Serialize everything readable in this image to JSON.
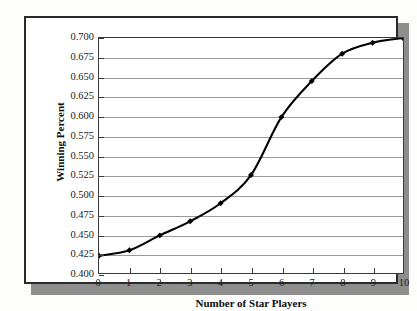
{
  "chart_data": {
    "type": "line",
    "title": "",
    "xlabel": "Number of Star Players",
    "ylabel": "Winning Percent",
    "x": [
      0,
      1,
      2,
      3,
      4,
      5,
      6,
      7,
      8,
      9,
      10
    ],
    "values": [
      0.422,
      0.429,
      0.448,
      0.466,
      0.489,
      0.525,
      0.599,
      0.645,
      0.68,
      0.694,
      0.7
    ],
    "xlim": [
      0,
      10
    ],
    "ylim": [
      0.4,
      0.7
    ],
    "xticks": [
      "0",
      "1",
      "2",
      "3",
      "4",
      "5",
      "6",
      "7",
      "8",
      "9",
      "10"
    ],
    "yticks": [
      "0.700",
      "0.675",
      "0.650",
      "0.625",
      "0.600",
      "0.575",
      "0.550",
      "0.525",
      "0.500",
      "0.475",
      "0.450",
      "0.425",
      "0.400"
    ],
    "ytick_values": [
      0.7,
      0.675,
      0.65,
      0.625,
      0.6,
      0.575,
      0.55,
      0.525,
      0.5,
      0.475,
      0.45,
      0.425,
      0.4
    ],
    "grid": "horizontal",
    "legend": "none",
    "marker": "diamond",
    "line_color": "#000000",
    "grid_color": "#9a9a9a",
    "frame_color": "#3a3a3a"
  }
}
